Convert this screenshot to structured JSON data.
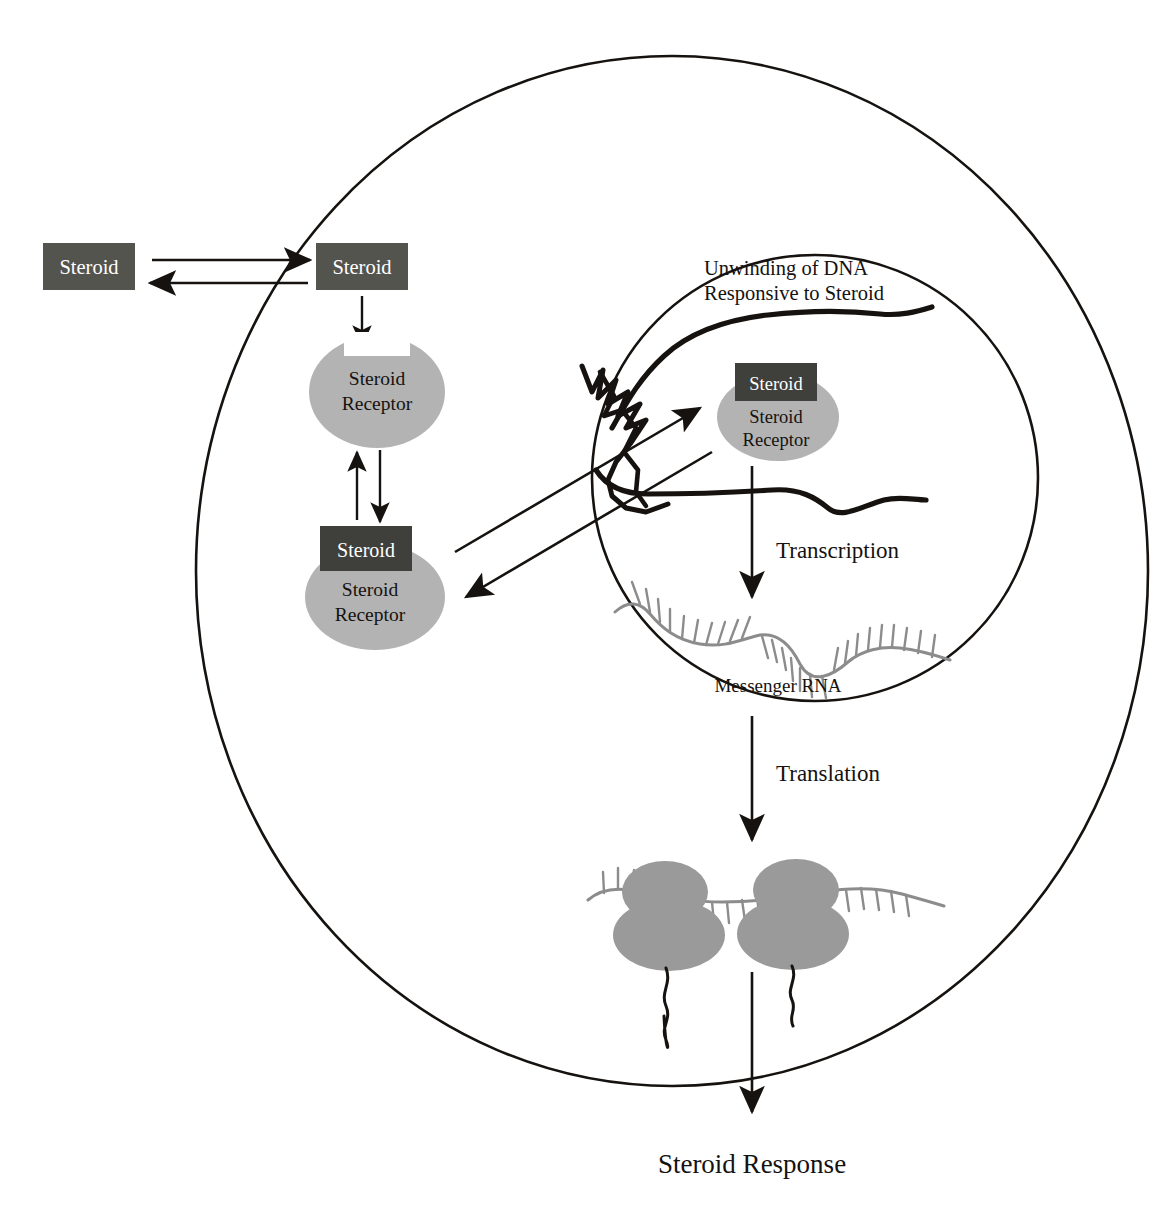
{
  "diagram": {
    "colors": {
      "steroid_box_fill": "#54544f",
      "steroid_box_text": "#ffffff",
      "receptor_fill": "#b3b3b3",
      "membrane_stroke": "#15120f",
      "dna_stroke": "#15120f",
      "mrna_stroke": "#8c8c8c",
      "ribosome_fill": "#9a9a9a",
      "background": "#ffffff"
    },
    "structures": {
      "cell_membrane": "cell-membrane-ellipse",
      "nucleus_membrane": "nucleus-circle"
    }
  },
  "extracellular": {
    "steroid_label": "Steroid"
  },
  "cytoplasm": {
    "steroid_label": "Steroid",
    "receptor_line1": "Steroid",
    "receptor_line2": "Receptor",
    "complex_steroid_label": "Steroid",
    "complex_receptor_line1": "Steroid",
    "complex_receptor_line2": "Receptor"
  },
  "nucleus": {
    "dna_caption_line1": "Unwinding of DNA",
    "dna_caption_line2": "Responsive to Steroid",
    "bound_steroid_label": "Steroid",
    "bound_receptor_line1": "Steroid",
    "bound_receptor_line2": "Receptor",
    "transcription_label": "Transcription",
    "mrna_label": "Messenger RNA"
  },
  "translation": {
    "label": "Translation"
  },
  "output": {
    "label": "Steroid Response"
  },
  "arrows": [
    {
      "name": "steroid-influx-arrow",
      "direction": "right",
      "description": "Steroid enters cell"
    },
    {
      "name": "steroid-efflux-arrow",
      "direction": "left",
      "description": "Steroid exits cell"
    },
    {
      "name": "steroid-to-receptor-arrow",
      "direction": "down",
      "description": "Steroid binds receptor"
    },
    {
      "name": "complex-formation-arrow",
      "direction": "down",
      "description": "Complex forms"
    },
    {
      "name": "complex-dissociation-arrow",
      "direction": "up",
      "description": "Complex dissociates"
    },
    {
      "name": "complex-into-nucleus-arrow",
      "direction": "up-right",
      "description": "Complex translocates into nucleus"
    },
    {
      "name": "complex-out-of-nucleus-arrow",
      "direction": "down-left",
      "description": "Complex exits nucleus"
    },
    {
      "name": "transcription-arrow",
      "direction": "down",
      "description": "DNA transcribed to mRNA"
    },
    {
      "name": "translation-arrow",
      "direction": "down",
      "description": "mRNA translated at ribosomes"
    },
    {
      "name": "steroid-response-arrow",
      "direction": "down",
      "description": "Protein produces steroid response"
    }
  ]
}
